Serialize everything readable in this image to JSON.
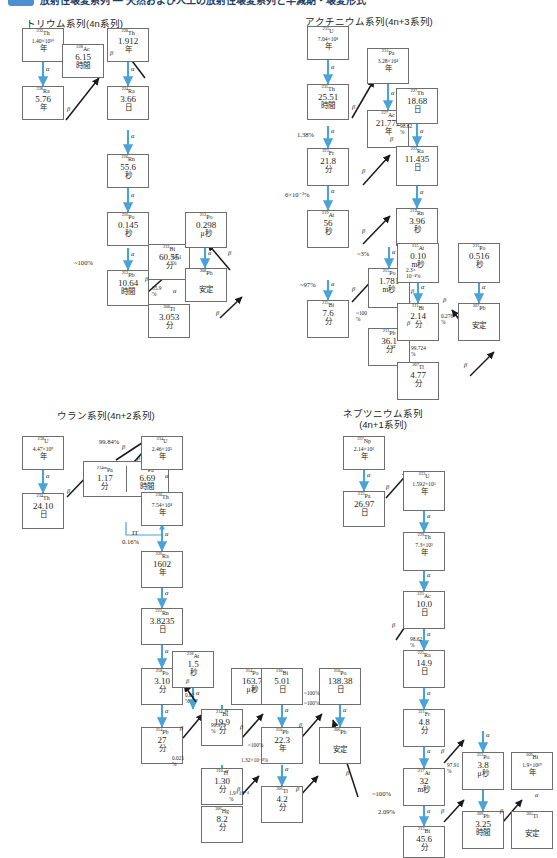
{
  "header": {
    "badge_color": "#4e8fd0",
    "title": "放射性壊変系列 ― 天然および人工の放射性壊変系列と半減期・壊変形式"
  },
  "decay_symbols": {
    "alpha": "α",
    "beta": "β",
    "it": "IT"
  },
  "colors": {
    "alpha_arrow": "#4aa3d8",
    "beta_arrow": "#1a1a1a",
    "box_border": "#6f6f6f",
    "text": "#231f20"
  },
  "series": [
    {
      "id": "thorium",
      "title": "トリウム系列(4n系列)",
      "nuclides": [
        {
          "name": "th-232",
          "mass": "232",
          "sym": "Th",
          "value": "1.40×10¹⁰",
          "value_small": true,
          "unit": "年"
        },
        {
          "name": "ra-228",
          "mass": "228",
          "sym": "Ra",
          "value": "5.76",
          "unit": "年"
        },
        {
          "name": "ac-228",
          "mass": "228",
          "sym": "Ac",
          "value": "6.15",
          "unit": "時間"
        },
        {
          "name": "th-228",
          "mass": "228",
          "sym": "Th",
          "value": "1.912",
          "unit": "年"
        },
        {
          "name": "ra-224",
          "mass": "224",
          "sym": "Ra",
          "value": "3.66",
          "unit": "日"
        },
        {
          "name": "rn-220",
          "mass": "220",
          "sym": "Rn",
          "value": "55.6",
          "unit": "秒"
        },
        {
          "name": "po-216",
          "mass": "216",
          "sym": "Po",
          "value": "0.145",
          "unit": "秒"
        },
        {
          "name": "pb-212",
          "mass": "212",
          "sym": "Pb",
          "value": "10.64",
          "unit": "時間"
        },
        {
          "name": "bi-212",
          "mass": "212",
          "sym": "Bi",
          "value": "60.55",
          "unit": "分"
        },
        {
          "name": "po-212",
          "mass": "212",
          "sym": "Po",
          "value": "0.298",
          "unit": "μ秒"
        },
        {
          "name": "tl-208",
          "mass": "208",
          "sym": "Tl",
          "value": "3.053",
          "unit": "分"
        },
        {
          "name": "pb-208",
          "mass": "208",
          "sym": "Pb",
          "value": "",
          "unit": "安定"
        }
      ],
      "branch_labels": [
        "~100%",
        "35.9\n%",
        "64.1\n%"
      ]
    },
    {
      "id": "actinium",
      "title": "アクチニウム系列(4n+3系列)",
      "nuclides": [
        {
          "name": "u-235",
          "mass": "235",
          "sym": "U",
          "value": "7.04×10⁸",
          "value_small": true,
          "unit": "年"
        },
        {
          "name": "th-231",
          "mass": "231",
          "sym": "Th",
          "value": "25.51",
          "unit": "時間"
        },
        {
          "name": "pa-231",
          "mass": "231",
          "sym": "Pa",
          "value": "3.28×10⁴",
          "value_small": true,
          "unit": "年"
        },
        {
          "name": "ac-227",
          "mass": "227",
          "sym": "Ac",
          "value": "21.772",
          "unit": "年"
        },
        {
          "name": "th-227",
          "mass": "227",
          "sym": "Th",
          "value": "18.68",
          "unit": "日"
        },
        {
          "name": "fr-223",
          "mass": "223",
          "sym": "Fr",
          "value": "21.8",
          "unit": "分"
        },
        {
          "name": "ra-223",
          "mass": "223",
          "sym": "Ra",
          "value": "11.435",
          "unit": "日"
        },
        {
          "name": "rn-219",
          "mass": "219",
          "sym": "Rn",
          "value": "3.96",
          "unit": "秒"
        },
        {
          "name": "at-219",
          "mass": "219",
          "sym": "At",
          "value": "56",
          "unit": "秒"
        },
        {
          "name": "po-215",
          "mass": "215",
          "sym": "Po",
          "value": "1.781",
          "unit": "m秒"
        },
        {
          "name": "at-215",
          "mass": "215",
          "sym": "At",
          "value": "0.10",
          "unit": "m秒"
        },
        {
          "name": "bi-215",
          "mass": "215",
          "sym": "Bi",
          "value": "7.6",
          "unit": "分"
        },
        {
          "name": "pb-211",
          "mass": "211",
          "sym": "Pb",
          "value": "36.1",
          "unit": "分"
        },
        {
          "name": "bi-211",
          "mass": "211",
          "sym": "Bi",
          "value": "2.14",
          "unit": "分"
        },
        {
          "name": "po-211",
          "mass": "211",
          "sym": "Po",
          "value": "0.516",
          "unit": "秒"
        },
        {
          "name": "tl-207",
          "mass": "207",
          "sym": "Tl",
          "value": "4.77",
          "unit": "分"
        },
        {
          "name": "pb-207",
          "mass": "207",
          "sym": "Pb",
          "value": "",
          "unit": "安定"
        }
      ],
      "branch_labels": [
        "98.62\n%",
        "1.38%",
        "6×10⁻³%",
        "~3%",
        "~97%",
        "~100\n%",
        "2.3×\n10⁻⁴%",
        "0.276\n%",
        "99.724\n%"
      ]
    },
    {
      "id": "uranium",
      "title": "ウラン系列(4n+2系列)",
      "nuclides": [
        {
          "name": "u-238",
          "mass": "238",
          "sym": "U",
          "value": "4.47×10⁹",
          "value_small": true,
          "unit": "年"
        },
        {
          "name": "th-234",
          "mass": "234",
          "sym": "Th",
          "value": "24.10",
          "unit": "日"
        },
        {
          "name": "pa-234m",
          "mass": "234m",
          "sym": "Pa",
          "value": "1.17",
          "unit": "分"
        },
        {
          "name": "pa-234",
          "mass": "234",
          "sym": "Pa",
          "value": "6.69",
          "unit": "時間"
        },
        {
          "name": "u-234",
          "mass": "234",
          "sym": "U",
          "value": "2.46×10⁵",
          "value_small": true,
          "unit": "年"
        },
        {
          "name": "th-230",
          "mass": "230",
          "sym": "Th",
          "value": "7.54×10⁴",
          "value_small": true,
          "unit": "年"
        },
        {
          "name": "ra-226",
          "mass": "226",
          "sym": "Ra",
          "value": "1602",
          "unit": "年"
        },
        {
          "name": "rn-222",
          "mass": "222",
          "sym": "Rn",
          "value": "3.8235",
          "unit": "日"
        },
        {
          "name": "po-218",
          "mass": "218",
          "sym": "Po",
          "value": "3.10",
          "unit": "分"
        },
        {
          "name": "at-218",
          "mass": "218",
          "sym": "At",
          "value": "1.5",
          "unit": "秒"
        },
        {
          "name": "pb-214",
          "mass": "214",
          "sym": "Pb",
          "value": "27",
          "unit": "分"
        },
        {
          "name": "bi-214",
          "mass": "214",
          "sym": "Bi",
          "value": "19.9",
          "unit": "分"
        },
        {
          "name": "po-214",
          "mass": "214",
          "sym": "Po",
          "value": "163.7",
          "unit": "μ秒"
        },
        {
          "name": "tl-210",
          "mass": "210",
          "sym": "Tl",
          "value": "1.30",
          "unit": "分"
        },
        {
          "name": "pb-210",
          "mass": "210",
          "sym": "Pb",
          "value": "22.3",
          "unit": "年"
        },
        {
          "name": "bi-210",
          "mass": "210",
          "sym": "Bi",
          "value": "5.01",
          "unit": "日"
        },
        {
          "name": "po-210",
          "mass": "210",
          "sym": "Po",
          "value": "138.38",
          "unit": "日"
        },
        {
          "name": "hg-206",
          "mass": "206",
          "sym": "Hg",
          "value": "8.2",
          "unit": "分"
        },
        {
          "name": "tl-206",
          "mass": "206",
          "sym": "Tl",
          "value": "4.2",
          "unit": "分"
        },
        {
          "name": "pb-206",
          "mass": "206",
          "sym": "Pb",
          "value": "",
          "unit": "安定"
        }
      ],
      "branch_labels": [
        "99.84%",
        "IT",
        "0.16%",
        "0.02\n%",
        "99.979\n%",
        "0.021\n%",
        "1.9×10⁻⁴\n%",
        "~100%",
        "1.32×10⁻⁴%",
        "~100%",
        "~100%"
      ]
    },
    {
      "id": "neptunium",
      "title": "ネプツニウム系列\n(4n+1系列)",
      "nuclides": [
        {
          "name": "np-237",
          "mass": "237",
          "sym": "Np",
          "value": "2.14×10⁶",
          "value_small": true,
          "unit": "年"
        },
        {
          "name": "pa-233",
          "mass": "233",
          "sym": "Pa",
          "value": "26.97",
          "unit": "日"
        },
        {
          "name": "u-233",
          "mass": "233",
          "sym": "U",
          "value": "1.592×10⁵",
          "value_small": true,
          "unit": "年"
        },
        {
          "name": "th-229",
          "mass": "229",
          "sym": "Th",
          "value": "7.3×10³",
          "value_small": true,
          "unit": "年"
        },
        {
          "name": "ra-225",
          "mass": "225",
          "sym": "Ra",
          "value": "14.9",
          "unit": "日"
        },
        {
          "name": "ac-225",
          "mass": "225",
          "sym": "Ac",
          "value": "10.0",
          "unit": "日"
        },
        {
          "name": "fr-221",
          "mass": "221",
          "sym": "Fr",
          "value": "4.8",
          "unit": "分"
        },
        {
          "name": "at-217",
          "mass": "217",
          "sym": "At",
          "value": "32",
          "unit": "m秒"
        },
        {
          "name": "bi-213",
          "mass": "213",
          "sym": "Bi",
          "value": "45.6",
          "unit": "分"
        },
        {
          "name": "po-213",
          "mass": "213",
          "sym": "Po",
          "value": "3.8",
          "unit": "μ秒"
        },
        {
          "name": "pb-209",
          "mass": "209",
          "sym": "Pb",
          "value": "3.25",
          "unit": "時間"
        },
        {
          "name": "tl-209",
          "mass": "209",
          "sym": "Tl",
          "value": "2.16",
          "unit": "分"
        },
        {
          "name": "bi-209",
          "mass": "209",
          "sym": "Bi",
          "value": "1.9×10¹⁹",
          "value_small": true,
          "unit": "年"
        },
        {
          "name": "tl-205",
          "mass": "205",
          "sym": "Tl",
          "value": "",
          "unit": "安定"
        }
      ],
      "branch_labels": [
        "98.62\n%",
        "~100%",
        "97.91\n%",
        "2.09%"
      ]
    }
  ]
}
